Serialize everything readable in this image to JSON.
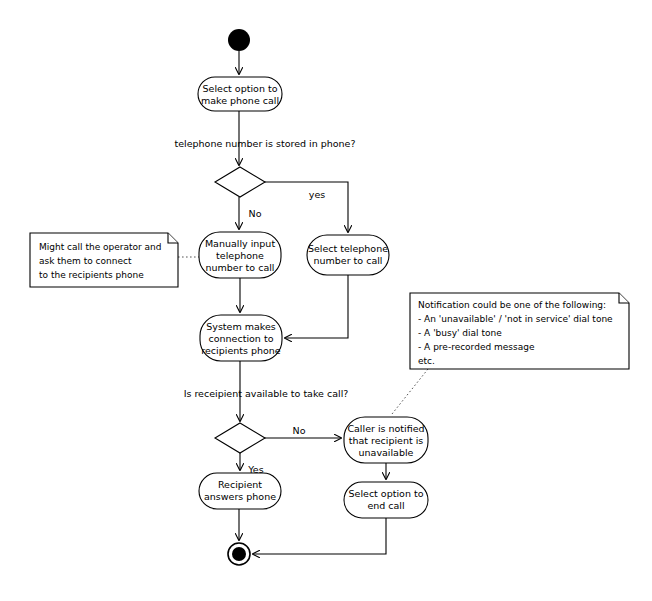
{
  "diagram": {
    "type": "uml-activity-diagram",
    "background_color": "#ffffff",
    "line_color": "#000000",
    "note_line_color": "#555555"
  },
  "nodes": {
    "start": {
      "name": "initial-node",
      "shape": "filled-circle",
      "cx": 239,
      "cy": 40,
      "r": 11
    },
    "activity_select_option": {
      "shape": "rounded-rectangle",
      "lines": [
        "Select option to",
        "make phone call"
      ],
      "x": 198,
      "y": 77,
      "w": 84,
      "h": 34
    },
    "decision_stored": {
      "shape": "diamond",
      "cx": 240,
      "cy": 182,
      "w": 48,
      "h": 29
    },
    "activity_manual_input": {
      "shape": "rounded-rectangle",
      "lines": [
        "Manually input",
        "telephone",
        "number to call"
      ],
      "x": 199,
      "y": 232,
      "w": 82,
      "h": 46
    },
    "activity_select_telephone": {
      "shape": "rounded-rectangle",
      "lines": [
        "Select telephone",
        "number to call"
      ],
      "x": 307,
      "y": 235,
      "w": 82,
      "h": 40
    },
    "activity_system_connection": {
      "shape": "rounded-rectangle",
      "lines": [
        "System makes",
        "connection to",
        "recipients phone"
      ],
      "x": 200,
      "y": 315,
      "w": 82,
      "h": 46
    },
    "decision_available": {
      "shape": "diamond",
      "cx": 240,
      "cy": 438,
      "w": 48,
      "h": 29
    },
    "activity_caller_notified": {
      "shape": "rounded-rectangle",
      "lines": [
        "Caller is notified",
        "that recipient is",
        "unavailable"
      ],
      "x": 344,
      "y": 417,
      "w": 84,
      "h": 46
    },
    "activity_recipient_answers": {
      "shape": "rounded-rectangle",
      "lines": [
        "Recipient",
        "answers phone"
      ],
      "x": 199,
      "y": 473,
      "w": 82,
      "h": 36
    },
    "activity_end_call": {
      "shape": "rounded-rectangle",
      "lines": [
        "Select option to",
        "end call"
      ],
      "x": 344,
      "y": 482,
      "w": 84,
      "h": 36
    },
    "final": {
      "shape": "final-node",
      "cx": 239,
      "cy": 554,
      "r_outer": 11,
      "r_inner": 7
    }
  },
  "labels": {
    "guard_stored_question": "telephone number is stored in phone?",
    "guard_stored_yes": "yes",
    "guard_stored_no": "No",
    "guard_available_question": "Is receipient available to take call?",
    "guard_available_no": "No",
    "guard_available_yes": "Yes"
  },
  "notes": {
    "operator_note": {
      "x": 30,
      "y": 233,
      "w": 148,
      "h": 54,
      "lines": [
        "Might call the operator and",
        "ask them to connect",
        "to the recipients phone"
      ]
    },
    "notification_note": {
      "x": 410,
      "y": 293,
      "w": 219,
      "h": 76,
      "lines": [
        "Notification could be one of the following:",
        "- An 'unavailable' / 'not in service' dial tone",
        "- A 'busy' dial tone",
        "- A pre-recorded message",
        "etc."
      ]
    }
  }
}
